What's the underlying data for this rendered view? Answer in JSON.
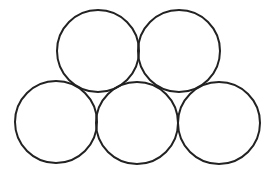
{
  "diagram": {
    "canvas": {
      "width": 268,
      "height": 175,
      "background": "#ffffff"
    },
    "stroke_color": "#222222",
    "stroke_width": 2,
    "circles": [
      {
        "id": "top-left",
        "cx": 98,
        "cy": 51,
        "r": 41
      },
      {
        "id": "top-right",
        "cx": 179,
        "cy": 51,
        "r": 41
      },
      {
        "id": "bottom-left",
        "cx": 56,
        "cy": 122,
        "r": 41
      },
      {
        "id": "bottom-middle",
        "cx": 137,
        "cy": 123,
        "r": 41
      },
      {
        "id": "bottom-right",
        "cx": 219,
        "cy": 123,
        "r": 41
      }
    ]
  }
}
